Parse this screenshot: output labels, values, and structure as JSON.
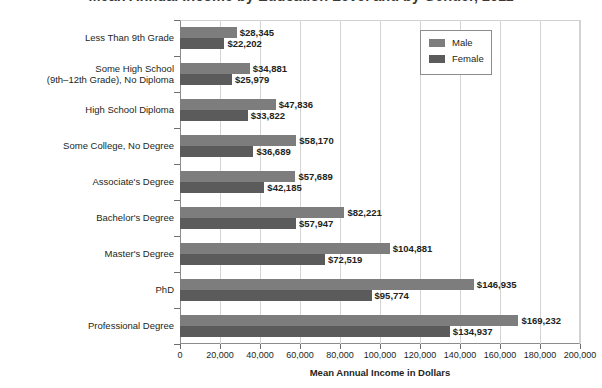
{
  "title": "Mean Annual Income by Education Level and by Gender, 2011",
  "legend": {
    "position": "top-right",
    "entries": [
      {
        "label": "Male",
        "color": "#7d7d7d",
        "icon": "legend-swatch-icon"
      },
      {
        "label": "Female",
        "color": "#5b5b5b",
        "icon": "legend-swatch-icon"
      }
    ]
  },
  "axis": {
    "x_title": "Mean Annual Income in Dollars",
    "x_ticklabels": [
      "0",
      "20,000",
      "40,000",
      "60,000",
      "80,000",
      "100,000",
      "120,000",
      "140,000",
      "160,000",
      "180,000",
      "200,000"
    ]
  },
  "chart_data": {
    "type": "bar",
    "orientation": "horizontal",
    "title": "Mean Annual Income by Education Level and by Gender, 2011",
    "xlabel": "Mean Annual Income in Dollars",
    "ylabel": "",
    "xlim": [
      0,
      200000
    ],
    "xticks": [
      0,
      20000,
      40000,
      60000,
      80000,
      100000,
      120000,
      140000,
      160000,
      180000,
      200000
    ],
    "grid": "vertical",
    "legend_position": "top-right",
    "categories": [
      "Less Than 9th Grade",
      "Some High School\n(9th–12th Grade), No Diploma",
      "High School Diploma",
      "Some College, No Degree",
      "Associate's Degree",
      "Bachelor's Degree",
      "Master's Degree",
      "PhD",
      "Professional Degree"
    ],
    "series": [
      {
        "name": "Male",
        "color": "#7d7d7d",
        "values": [
          28345,
          34881,
          47836,
          58170,
          57689,
          82221,
          104881,
          146935,
          169232
        ],
        "labels": [
          "$28,345",
          "$34,881",
          "$47,836",
          "$58,170",
          "$57,689",
          "$82,221",
          "$104,881",
          "$146,935",
          "$169,232"
        ]
      },
      {
        "name": "Female",
        "color": "#5b5b5b",
        "values": [
          22202,
          25979,
          33822,
          36689,
          42185,
          57947,
          72519,
          95774,
          134937
        ],
        "labels": [
          "$22,202",
          "$25,979",
          "$33,822",
          "$36,689",
          "$42,185",
          "$57,947",
          "$72,519",
          "$95,774",
          "$134,937"
        ]
      }
    ]
  }
}
